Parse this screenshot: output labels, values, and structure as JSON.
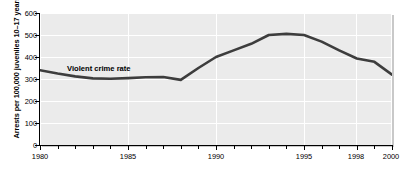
{
  "chart_data": {
    "type": "line",
    "title": "",
    "xlabel": "",
    "ylabel": "Arrests per 100,000 juveniles 10–17 years",
    "xlim": [
      1980,
      2000
    ],
    "ylim": [
      0,
      600
    ],
    "grid": true,
    "legend": "none",
    "annotations": [
      {
        "text": "Violent crime rate",
        "x": 1982.8,
        "y": 390
      }
    ],
    "xticks_major": [
      1980,
      1985,
      1990,
      1995,
      1998,
      2000
    ],
    "xtick_labels": [
      "1980",
      "1985",
      "1990",
      "1995",
      "1998",
      "2000"
    ],
    "yticks": [
      0,
      100,
      200,
      300,
      400,
      500,
      600
    ],
    "ytick_labels": [
      "0",
      "100",
      "200",
      "300",
      "400",
      "500",
      "600"
    ],
    "series": [
      {
        "name": "Violent crime rate",
        "color": "#3d3d3d",
        "x": [
          1980,
          1981,
          1982,
          1983,
          1984,
          1985,
          1986,
          1987,
          1988,
          1989,
          1990,
          1991,
          1992,
          1993,
          1994,
          1995,
          1996,
          1997,
          1998,
          1999,
          2000
        ],
        "values": [
          340,
          325,
          312,
          303,
          301,
          304,
          308,
          309,
          296,
          350,
          400,
          430,
          460,
          500,
          505,
          500,
          470,
          430,
          393,
          378,
          320
        ]
      }
    ]
  },
  "axis": {
    "ytick_labels": [
      "600",
      "500",
      "400",
      "300",
      "200",
      "100",
      "0"
    ],
    "xtick_labels": [
      "1980",
      "1985",
      "1990",
      "1995",
      "1998",
      "2000"
    ],
    "ylabel": "Arrests per 100,000 juveniles 10–17 years"
  },
  "annotation": {
    "series_label": "Violent crime rate"
  }
}
